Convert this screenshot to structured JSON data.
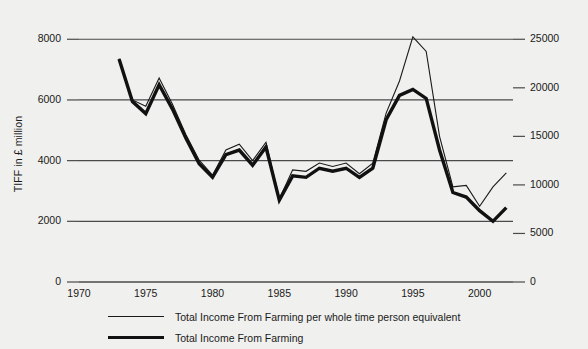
{
  "chart_data": {
    "type": "line",
    "title": "",
    "subtitle": "",
    "xlabel": "",
    "ylabel": "TIFF in £ million",
    "y2label": "£ per head whole time person equivalent",
    "grid": true,
    "legend_position": "bottom",
    "xlim": [
      1970,
      2002.5
    ],
    "ylim": [
      0,
      8800
    ],
    "y2lim": [
      0,
      27500
    ],
    "xticks": [
      1970,
      1975,
      1980,
      1985,
      1990,
      1995,
      2000
    ],
    "xticklabels": [
      "1970",
      "1975",
      "1980",
      "1985",
      "1990",
      "1995",
      "2000"
    ],
    "yticks": [
      0,
      2000,
      4000,
      6000,
      8000
    ],
    "yticklabels": [
      "0",
      "2000",
      "4000",
      "6000",
      "8000"
    ],
    "y2ticks": [
      0,
      5000,
      10000,
      15000,
      20000,
      25000
    ],
    "y2ticklabels": [
      "0",
      "5000",
      "10000",
      "15000",
      "20000",
      "25000"
    ],
    "x": [
      1973,
      1974,
      1975,
      1976,
      1977,
      1978,
      1979,
      1980,
      1981,
      1982,
      1983,
      1984,
      1985,
      1986,
      1987,
      1988,
      1989,
      1990,
      1991,
      1992,
      1993,
      1994,
      1995,
      1996,
      1997,
      1998,
      1999,
      2000,
      2001,
      2002
    ],
    "series": [
      {
        "name": "Total Income From Farming per whole time person equivalent",
        "axis": "right",
        "color": "#1a1a1a",
        "width": 1.1,
        "values": [
          23000,
          18750,
          18100,
          21000,
          18300,
          15200,
          12550,
          11000,
          13600,
          14200,
          12500,
          14400,
          8550,
          11550,
          11400,
          12250,
          11900,
          12250,
          11150,
          12250,
          17400,
          20700,
          25250,
          23750,
          15000,
          9800,
          9950,
          7800,
          9800,
          11250
        ]
      },
      {
        "name": "Total Income From Farming",
        "axis": "left",
        "color": "#111111",
        "width": 3.4,
        "values": [
          7350,
          5950,
          5550,
          6500,
          5700,
          4750,
          3900,
          3450,
          4200,
          4350,
          3850,
          4450,
          2700,
          3500,
          3450,
          3750,
          3650,
          3750,
          3450,
          3750,
          5350,
          6150,
          6350,
          6050,
          4350,
          2950,
          2800,
          2350,
          2000,
          2450
        ]
      }
    ]
  },
  "axes": {
    "left_title": "TIFF in £ million",
    "right_title": "£ per head whole time person equivalent"
  },
  "legend": {
    "items": [
      {
        "label": "Total Income From Farming per whole time person equivalent",
        "style": "thin"
      },
      {
        "label": "Total Income From Farming",
        "style": "thick"
      }
    ]
  }
}
